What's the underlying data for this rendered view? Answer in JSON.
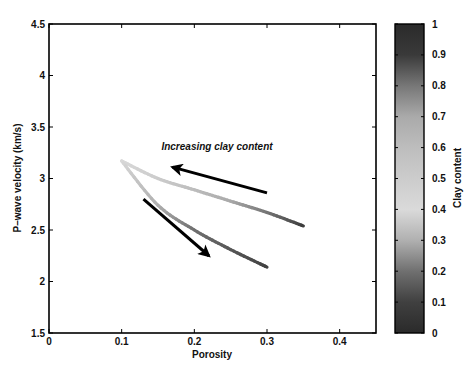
{
  "chart_data": {
    "type": "line",
    "title": "",
    "xlabel": "Porosity",
    "ylabel": "P–wave velocity (km/s)",
    "xlim": [
      0,
      0.45
    ],
    "ylim": [
      1.5,
      4.5
    ],
    "xticks": [
      0,
      0.1,
      0.2,
      0.3,
      0.4
    ],
    "xtick_labels": [
      "0",
      "0.1",
      "0.2",
      "0.3",
      "0.4"
    ],
    "yticks": [
      1.5,
      2,
      2.5,
      3,
      3.5,
      4,
      4.5
    ],
    "ytick_labels": [
      "1.5",
      "2",
      "2.5",
      "3",
      "3.5",
      "4",
      "4.5"
    ],
    "grid": false,
    "series": [
      {
        "name": "upper trend",
        "x": [
          0.1,
          0.15,
          0.2,
          0.25,
          0.3,
          0.35
        ],
        "y": [
          3.17,
          3.0,
          2.89,
          2.78,
          2.67,
          2.54
        ],
        "clay_content": [
          0.4,
          0.5,
          0.6,
          0.7,
          0.8,
          0.9
        ]
      },
      {
        "name": "lower trend",
        "x": [
          0.1,
          0.15,
          0.2,
          0.25,
          0.3
        ],
        "y": [
          3.17,
          2.74,
          2.5,
          2.31,
          2.14
        ],
        "clay_content": [
          0.4,
          0.3,
          0.2,
          0.15,
          0.1
        ]
      }
    ],
    "annotations": [
      {
        "text": "Increasing clay content",
        "x": 0.23,
        "y": 3.33
      },
      {
        "type": "arrow",
        "from": [
          0.3,
          2.86
        ],
        "to": [
          0.17,
          3.11
        ]
      },
      {
        "type": "arrow",
        "from": [
          0.13,
          2.8
        ],
        "to": [
          0.22,
          2.25
        ]
      }
    ],
    "colorbar": {
      "label": "Clay content",
      "range": [
        0,
        1
      ],
      "ticks": [
        0,
        0.1,
        0.2,
        0.3,
        0.4,
        0.5,
        0.6,
        0.7,
        0.8,
        0.9,
        1
      ],
      "tick_labels": [
        "0",
        "0.1",
        "0.2",
        "0.3",
        "0.4",
        "0.5",
        "0.6",
        "0.7",
        "0.8",
        "0.9",
        "1"
      ],
      "colormap_stops": [
        {
          "v": 0.0,
          "color": "#2a2a2a"
        },
        {
          "v": 0.1,
          "color": "#404040"
        },
        {
          "v": 0.2,
          "color": "#707070"
        },
        {
          "v": 0.3,
          "color": "#b0b0b0"
        },
        {
          "v": 0.4,
          "color": "#dadada"
        },
        {
          "v": 0.5,
          "color": "#cccccc"
        },
        {
          "v": 0.6,
          "color": "#bdbdbd"
        },
        {
          "v": 0.7,
          "color": "#aaaaaa"
        },
        {
          "v": 0.8,
          "color": "#777777"
        },
        {
          "v": 0.9,
          "color": "#3a3a3a"
        },
        {
          "v": 1.0,
          "color": "#2a2a2a"
        }
      ]
    }
  }
}
